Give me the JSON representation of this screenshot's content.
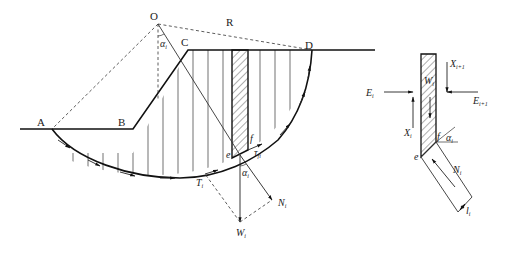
{
  "figure": {
    "slope_diagram": {
      "points": {
        "O": "O",
        "R": "R",
        "A": "A",
        "B": "B",
        "C": "C",
        "D": "D"
      },
      "angle_top": "α",
      "angle_top_sub": "i",
      "angle_base": "α",
      "angle_base_sub": "i",
      "tau": "τ",
      "tau_sub": "fi",
      "e": "e",
      "f": "f",
      "T": "T",
      "T_sub": "i",
      "N": "N",
      "N_sub": "i",
      "W": "W",
      "W_sub": "i"
    },
    "slice_diagram": {
      "E_left": "E",
      "E_left_sub": "i",
      "E_right": "E",
      "E_right_sub": "i+1",
      "X_left": "X",
      "X_left_sub": "i",
      "X_right": "X",
      "X_right_sub": "i+1",
      "W": "W",
      "W_sub": "i",
      "N": "N",
      "N_sub": "i",
      "l": "l",
      "l_sub": "i",
      "alpha": "α",
      "alpha_sub": "i",
      "e": "e",
      "f": "f"
    }
  }
}
